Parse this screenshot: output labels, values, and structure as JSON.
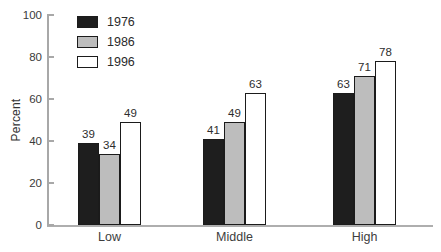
{
  "chart_data": {
    "type": "bar",
    "categories": [
      "Low",
      "Middle",
      "High"
    ],
    "series": [
      {
        "name": "1976",
        "color": "#1e1e1e",
        "values": [
          39,
          41,
          63
        ]
      },
      {
        "name": "1986",
        "color": "#bdbdbd",
        "values": [
          34,
          49,
          71
        ]
      },
      {
        "name": "1996",
        "color": "#ffffff",
        "values": [
          49,
          63,
          78
        ]
      }
    ],
    "title": "",
    "xlabel": "",
    "ylabel": "Percent",
    "ylim": [
      0,
      100
    ],
    "yticks": [
      0,
      20,
      40,
      60,
      80,
      100
    ],
    "grid": false,
    "legend_position": "top-left",
    "bar_value_labels": true
  }
}
